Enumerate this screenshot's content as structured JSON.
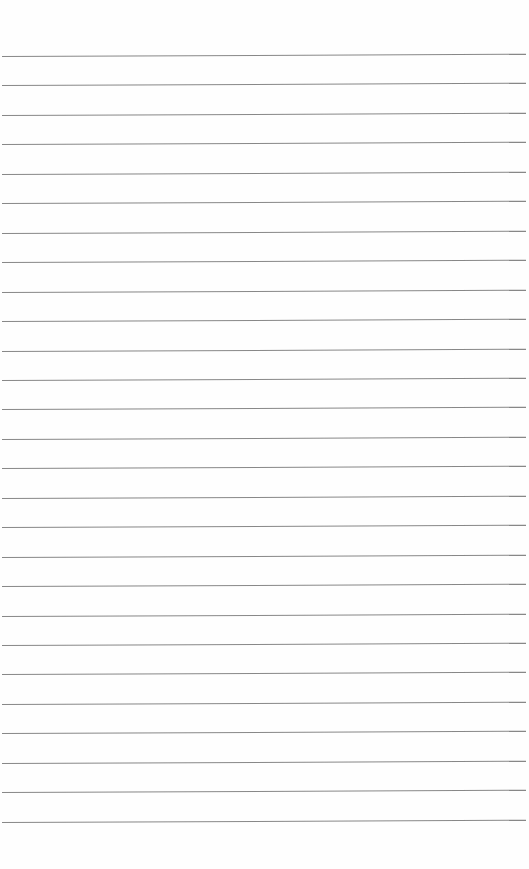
{
  "page": {
    "type": "lined-paper",
    "line_color": "#7a7a7a",
    "background": "#fefefe",
    "first_line_y": 56,
    "line_spacing": 29.45,
    "line_count": 27
  }
}
